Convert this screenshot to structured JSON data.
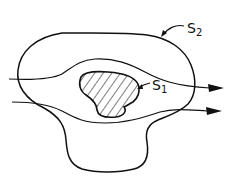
{
  "diagram": {
    "type": "region-flow",
    "labels": {
      "outer_surface": "S",
      "outer_surface_sub": "2",
      "inner_surface": "S",
      "inner_surface_sub": "1"
    },
    "elements": [
      {
        "name": "outer-region-S2",
        "kind": "closed-curve"
      },
      {
        "name": "inner-body-S1",
        "kind": "hatched-closed-curve"
      },
      {
        "name": "streamline-upper",
        "kind": "arrow-line"
      },
      {
        "name": "streamline-lower",
        "kind": "arrow-line"
      }
    ],
    "colors": {
      "stroke": "#111111",
      "background": "#ffffff"
    }
  }
}
